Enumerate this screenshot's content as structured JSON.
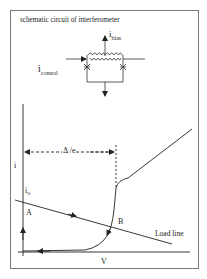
{
  "schematic": {
    "title": "schematic circuit of interferometer",
    "bias_label": "i",
    "bias_sub": "bias",
    "control_label": "i",
    "control_sub": "control"
  },
  "plot": {
    "y_axis_label": "i",
    "x_axis_label": "V",
    "delta_label": "Δ /e",
    "i0_label": "i",
    "i0_sub": "o",
    "point_a": "A",
    "point_b": "B",
    "load_line_label": "Load line"
  },
  "colors": {
    "line": "#222222",
    "frame": "#7a7a7a",
    "background": "#ffffff"
  }
}
